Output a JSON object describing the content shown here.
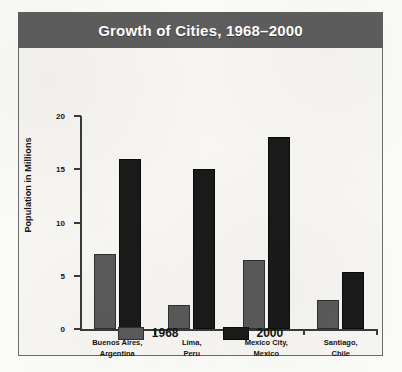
{
  "chart_data": {
    "type": "bar",
    "title": "Growth of Cities, 1968–2000",
    "xlabel": "",
    "ylabel": "Population in Millions",
    "ylim": [
      0,
      20
    ],
    "yticks": [
      "0",
      "5",
      "10",
      "15",
      "20"
    ],
    "grid": false,
    "legend_position": "bottom",
    "categories": [
      "Buenos Aires,\nArgentina",
      "Lima,\nPeru",
      "Mexico City,\nMexico",
      "Santiago,\nChile"
    ],
    "category_lines": [
      [
        "Buenos Aires,",
        "Argentina"
      ],
      [
        "Lima,",
        "Peru"
      ],
      [
        "Mexico City,",
        "Mexico"
      ],
      [
        "Santiago,",
        "Chile"
      ]
    ],
    "series": [
      {
        "name": "1968",
        "color": "#5a5a5a",
        "values": [
          7,
          2.3,
          6.5,
          2.7
        ]
      },
      {
        "name": "2000",
        "color": "#1a1a1a",
        "values": [
          16,
          15,
          18,
          5.4
        ]
      }
    ]
  },
  "colors": {
    "title_bar": "#5d5d5d",
    "title_text": "#ffffff",
    "axis": "#3a3a3a",
    "page_background": "#fbfbf8",
    "plot_background": "#f7f6f2"
  }
}
